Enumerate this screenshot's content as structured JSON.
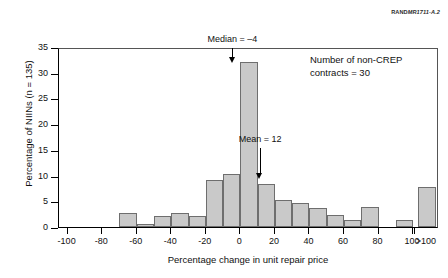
{
  "credit": {
    "prefix": "RAND",
    "code": "MR1711-A.2"
  },
  "chart_data": {
    "type": "bar",
    "title": "",
    "xlabel": "Percentage change in unit repair price",
    "ylabel": "Percentage of NIINs (n = 135)",
    "xlim": [
      -105,
      115
    ],
    "ylim": [
      0,
      35
    ],
    "grid": false,
    "legend": "none",
    "bin_width": 10,
    "xticks": [
      -100,
      -80,
      -60,
      -40,
      -20,
      0,
      20,
      40,
      60,
      80,
      100
    ],
    "xticklabels": [
      "-100",
      "-80",
      "-60",
      "-40",
      "-20",
      "0",
      "20",
      "40",
      "60",
      "80",
      "100",
      ">100"
    ],
    "yticks": [
      0,
      5,
      10,
      15,
      20,
      25,
      30,
      35
    ],
    "yticklabels": [
      "0",
      "5",
      "10",
      "15",
      "20",
      "25",
      "30",
      "35"
    ],
    "bins": [
      {
        "label": "-70 to -60",
        "x0": -70,
        "x1": -60,
        "value": 2.8
      },
      {
        "label": "-60 to -50",
        "x0": -60,
        "x1": -50,
        "value": 0.5
      },
      {
        "label": "-50 to -40",
        "x0": -50,
        "x1": -40,
        "value": 2.2
      },
      {
        "label": "-40 to -30",
        "x0": -40,
        "x1": -30,
        "value": 2.8
      },
      {
        "label": "-30 to -20",
        "x0": -30,
        "x1": -20,
        "value": 2.2
      },
      {
        "label": "-20 to -10",
        "x0": -20,
        "x1": -10,
        "value": 9.2
      },
      {
        "label": "-10 to 0",
        "x0": -10,
        "x1": 0,
        "value": 10.3
      },
      {
        "label": "0 to 10",
        "x0": 0,
        "x1": 10,
        "value": 32.0
      },
      {
        "label": "10 to 20",
        "x0": 10,
        "x1": 20,
        "value": 8.4
      },
      {
        "label": "20 to 30",
        "x0": 20,
        "x1": 30,
        "value": 5.3
      },
      {
        "label": "30 to 40",
        "x0": 30,
        "x1": 40,
        "value": 4.6
      },
      {
        "label": "40 to 50",
        "x0": 40,
        "x1": 50,
        "value": 3.7
      },
      {
        "label": "50 to 60",
        "x0": 50,
        "x1": 60,
        "value": 2.4
      },
      {
        "label": "60 to 70",
        "x0": 60,
        "x1": 70,
        "value": 1.4
      },
      {
        "label": "70 to 80",
        "x0": 70,
        "x1": 80,
        "value": 3.8
      },
      {
        "label": "90 to 100",
        "x0": 90,
        "x1": 100,
        "value": 1.4
      },
      {
        "label": ">100",
        "x0": 103,
        "x1": 113,
        "value": 7.7
      }
    ],
    "annotations": [
      {
        "name": "median",
        "text": "Median = –4",
        "value": -4,
        "arrow_top": 35,
        "arrow_bottom": 32
      },
      {
        "name": "mean",
        "text": "Mean = 12",
        "value": 12,
        "arrow_top": 15.5,
        "arrow_bottom": 9.5
      }
    ],
    "note": {
      "line1": "Number of non-CREP",
      "line2": "contracts = 30"
    },
    "colors": {
      "bar_fill": "#c9c9c9",
      "bar_edge": "#6e6e6e",
      "axis": "#000000",
      "text": "#111111"
    }
  }
}
